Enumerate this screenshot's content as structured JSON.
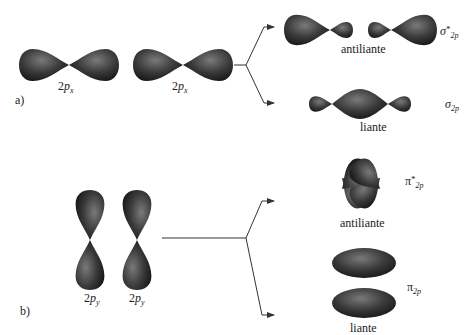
{
  "panel_a": {
    "label": "a)",
    "orbitals": [
      {
        "prefix": "2",
        "letter": "p",
        "subscript": "x"
      },
      {
        "prefix": "2",
        "letter": "p",
        "subscript": "x"
      }
    ],
    "antibonding": {
      "symbol": "σ",
      "star": "*",
      "subscript": "2p",
      "caption": "antiliante"
    },
    "bonding": {
      "symbol": "σ",
      "subscript": "2p",
      "caption": "liante"
    }
  },
  "panel_b": {
    "label": "b)",
    "orbitals": [
      {
        "prefix": "2",
        "letter": "p",
        "subscript": "y"
      },
      {
        "prefix": "2",
        "letter": "p",
        "subscript": "y"
      }
    ],
    "antibonding": {
      "symbol": "π",
      "star": "*",
      "subscript": "2p",
      "caption": "antiliante"
    },
    "bonding": {
      "symbol": "π",
      "subscript": "2p",
      "caption": "liante"
    }
  },
  "colors": {
    "lobe_dark": "#1e1e1e",
    "lobe_light": "#6a6a6a",
    "line": "#333333",
    "background": "#ffffff"
  }
}
